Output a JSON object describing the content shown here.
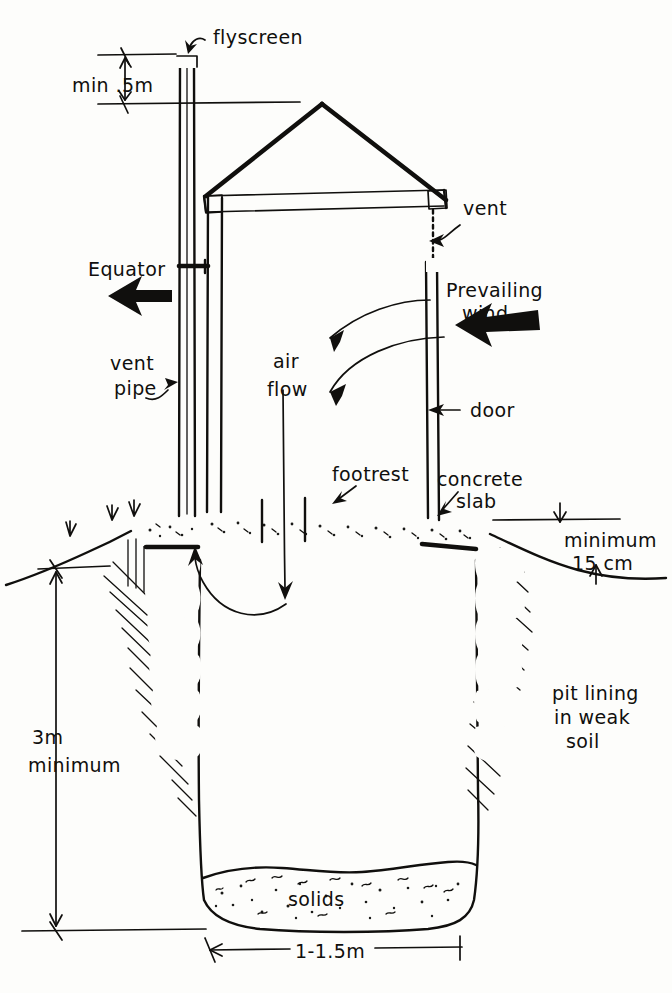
{
  "diagram": {
    "style": "hand-drawn line drawing",
    "background_color": "#fdfdfb",
    "ink_color": "#100f0d"
  },
  "labels": {
    "flyscreen": "flyscreen",
    "min_half_m": "min .5m",
    "equator": "Equator",
    "vent_pipe_line1": "vent",
    "vent_pipe_line2": "pipe",
    "air_line1": "air",
    "air_line2": "flow",
    "vent": "vent",
    "prevailing_line1": "Prevailing",
    "prevailing_line2": "wind",
    "door": "door",
    "footrest": "footrest",
    "concrete_line1": "concrete",
    "concrete_line2": "slab",
    "minimum_line1": "minimum",
    "minimum_line2": "15 cm",
    "pit_lining_line1": "pit lining",
    "pit_lining_line2": "in weak",
    "pit_lining_line3": "soil",
    "depth_line1": "3m",
    "depth_line2": "minimum",
    "solids": "solids",
    "width": "1-1.5m"
  },
  "dimensions": [
    {
      "name": "vent-pipe-above-roof",
      "value": "min .5m"
    },
    {
      "name": "slab-above-ground",
      "value": "minimum 15 cm"
    },
    {
      "name": "pit-depth",
      "value": "3m minimum"
    },
    {
      "name": "pit-diameter",
      "value": "1-1.5m"
    }
  ],
  "components": [
    {
      "name": "flyscreen",
      "label": "flyscreen"
    },
    {
      "name": "vent-pipe",
      "label": "vent pipe"
    },
    {
      "name": "vent",
      "label": "vent"
    },
    {
      "name": "door",
      "label": "door"
    },
    {
      "name": "footrest",
      "label": "footrest"
    },
    {
      "name": "concrete-slab",
      "label": "concrete slab"
    },
    {
      "name": "pit-lining",
      "label": "pit lining in weak soil"
    },
    {
      "name": "solids",
      "label": "solids"
    }
  ],
  "direction_arrows": [
    {
      "name": "equator-arrow",
      "label": "Equator",
      "points": "left"
    },
    {
      "name": "prevailing-wind-arrow",
      "label": "Prevailing wind",
      "points": "left"
    }
  ],
  "flow_arrows": [
    {
      "name": "airflow-through-vent",
      "label": "air flow"
    },
    {
      "name": "airflow-through-door",
      "label": "air flow"
    },
    {
      "name": "airflow-down-squat-hole",
      "label": "air flow"
    },
    {
      "name": "airflow-up-vent-pipe",
      "label": "air flow"
    }
  ]
}
